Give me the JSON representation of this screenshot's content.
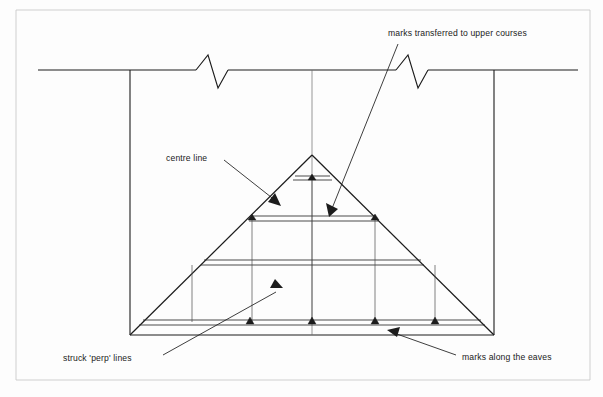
{
  "figure": {
    "type": "technical-diagram",
    "background_color": "#fdfdfd",
    "ink_color": "#1c1c1c",
    "width": 603,
    "height": 397
  },
  "labels": {
    "marks_transferred": "marks transferred to upper courses",
    "centre_line": "centre line",
    "struck_perp_lines": "struck 'perp' lines",
    "marks_along_eaves": "marks along the eaves"
  },
  "geometry": {
    "wall_top_y": 70,
    "wall_base_y": 335,
    "wall_left_x": 130,
    "wall_right_x": 494,
    "apex_x": 312,
    "apex_y": 155,
    "break_symbol_1_x": 212,
    "break_symbol_2_x": 412,
    "course_bands_y": [
      178,
      218,
      262,
      322
    ],
    "eave_mark_x": [
      250,
      312,
      375,
      435
    ],
    "upper_mark_x": [
      252,
      375
    ],
    "apex_mark_x": [
      312
    ],
    "perp_line_x": [
      252,
      312,
      375,
      435
    ]
  },
  "annotations": [
    {
      "name": "marks-transferred-to-upper-courses",
      "text": "marks transferred to upper courses",
      "text_x": 388,
      "text_y": 36,
      "leader_from": [
        398,
        44
      ],
      "leader_to": [
        329,
        215
      ]
    },
    {
      "name": "centre-line",
      "text": "centre line",
      "text_x": 166,
      "text_y": 161,
      "leader_from": [
        224,
        160
      ],
      "leader_to": [
        280,
        205
      ]
    },
    {
      "name": "struck-perp-lines",
      "text": "struck 'perp' lines",
      "text_x": 63,
      "text_y": 361,
      "leader_from": [
        163,
        355
      ],
      "leader_to": [
        282,
        288
      ]
    },
    {
      "name": "marks-along-the-eaves",
      "text": "marks along the eaves",
      "text_x": 462,
      "text_y": 360,
      "leader_from": [
        456,
        355
      ],
      "leader_to": [
        388,
        330
      ]
    }
  ]
}
